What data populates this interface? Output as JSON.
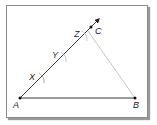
{
  "diagram": {
    "type": "geometric-construction",
    "points": {
      "A": {
        "label": "A",
        "x": 20,
        "y": 98
      },
      "B": {
        "label": "B",
        "x": 135,
        "y": 98
      },
      "C": {
        "label": "C",
        "x": 91,
        "y": 27
      }
    },
    "ray_marks": [
      {
        "label": "X",
        "x": 42,
        "y": 78
      },
      {
        "label": "Y",
        "x": 64,
        "y": 57
      },
      {
        "label": "Z",
        "x": 85,
        "y": 36
      }
    ],
    "segments": [
      {
        "from": "A",
        "to": "B",
        "color": "#222222"
      },
      {
        "from": "A",
        "to": "arrow",
        "color": "#222222"
      },
      {
        "from": "Z",
        "to": "B",
        "color": "#b0b0b0"
      }
    ]
  }
}
